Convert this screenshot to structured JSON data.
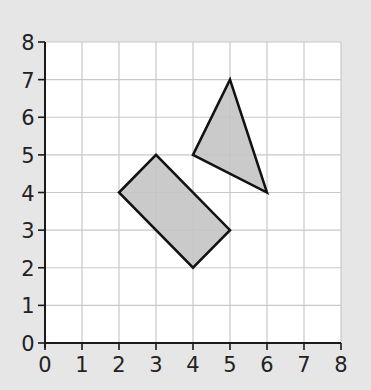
{
  "diagram": {
    "type": "coordinate-grid",
    "background": "#e6e6e6",
    "plot_background": "#ffffff",
    "grid_color": "#c8c8c8",
    "axis_color": "#1a1a1a",
    "shape_fill": "#c4c4c4",
    "shape_stroke": "#111111",
    "x_range": [
      0,
      8
    ],
    "y_range": [
      0,
      8
    ],
    "x_ticks": [
      "0",
      "1",
      "2",
      "3",
      "4",
      "5",
      "6",
      "7",
      "8"
    ],
    "y_ticks": [
      "0",
      "1",
      "2",
      "3",
      "4",
      "5",
      "6",
      "7",
      "8"
    ],
    "shapes": [
      {
        "name": "rectangle",
        "vertices": [
          [
            2,
            4
          ],
          [
            3,
            5
          ],
          [
            5,
            3
          ],
          [
            4,
            2
          ]
        ]
      },
      {
        "name": "triangle",
        "vertices": [
          [
            4,
            5
          ],
          [
            5,
            7
          ],
          [
            6,
            4
          ]
        ]
      }
    ]
  }
}
